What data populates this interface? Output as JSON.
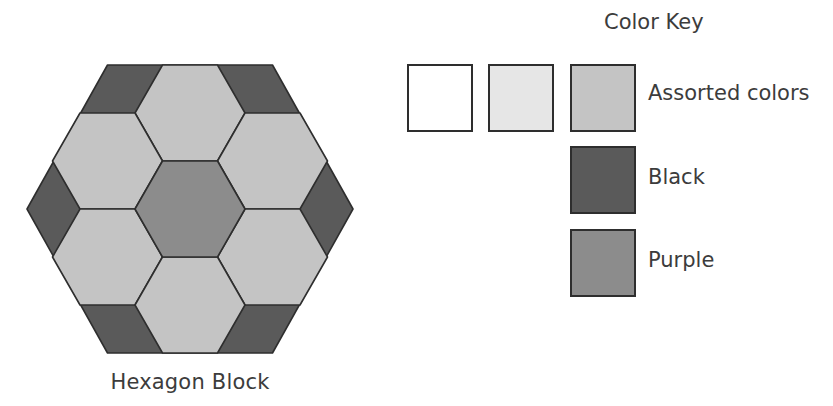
{
  "figure": {
    "caption": "Hexagon Block",
    "block": {
      "outer_hexagon": {
        "fill": "#5a5a5a",
        "role": "Black"
      },
      "center_hexagon": {
        "fill": "#8c8c8c",
        "role": "Purple"
      },
      "ring_hexagons": {
        "count": 6,
        "fill": "#c4c4c4",
        "role": "Assorted colors"
      },
      "corner_pieces": {
        "count": 6,
        "fill": "#5a5a5a",
        "role": "Black"
      }
    }
  },
  "color_key": {
    "title": "Color Key",
    "swatches": [
      {
        "fill": "#ffffff",
        "label": ""
      },
      {
        "fill": "#e6e6e6",
        "label": ""
      },
      {
        "fill": "#c4c4c4",
        "label": "Assorted colors"
      },
      {
        "fill": "#5a5a5a",
        "label": "Black"
      },
      {
        "fill": "#8c8c8c",
        "label": "Purple"
      }
    ],
    "labels": {
      "assorted": "Assorted colors",
      "black": "Black",
      "purple": "Purple"
    }
  },
  "colors": {
    "stroke": "#2e2e2e",
    "dark": "#5a5a5a",
    "medium": "#8c8c8c",
    "light": "#c4c4c4",
    "very_light": "#e6e6e6",
    "white": "#ffffff"
  }
}
